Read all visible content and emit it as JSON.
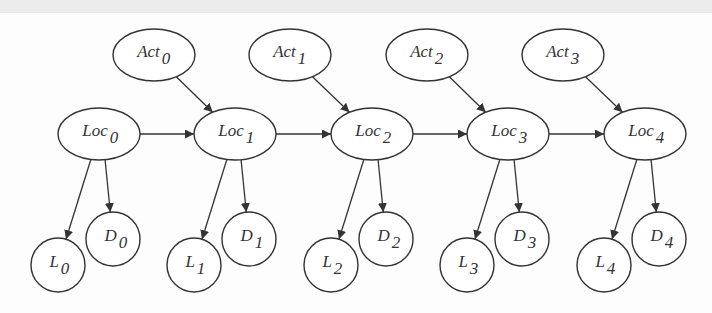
{
  "diagram": {
    "type": "dynamic-bayesian-network",
    "colors": {
      "stroke": "#333333",
      "background": "#fdfdfd",
      "top_band": "#ebebeb"
    },
    "nodes": [
      {
        "id": "Act0",
        "base": "Act",
        "sub": "0",
        "shape": "ellipse",
        "cx": 154,
        "cy": 55,
        "rx": 41,
        "ry": 26
      },
      {
        "id": "Act1",
        "base": "Act",
        "sub": "1",
        "shape": "ellipse",
        "cx": 290,
        "cy": 55,
        "rx": 41,
        "ry": 26
      },
      {
        "id": "Act2",
        "base": "Act",
        "sub": "2",
        "shape": "ellipse",
        "cx": 427,
        "cy": 55,
        "rx": 41,
        "ry": 26
      },
      {
        "id": "Act3",
        "base": "Act",
        "sub": "3",
        "shape": "ellipse",
        "cx": 563,
        "cy": 55,
        "rx": 41,
        "ry": 26
      },
      {
        "id": "Loc0",
        "base": "Loc",
        "sub": "0",
        "shape": "ellipse",
        "cx": 99,
        "cy": 134,
        "rx": 41,
        "ry": 26
      },
      {
        "id": "Loc1",
        "base": "Loc",
        "sub": "1",
        "shape": "ellipse",
        "cx": 235,
        "cy": 134,
        "rx": 41,
        "ry": 26
      },
      {
        "id": "Loc2",
        "base": "Loc",
        "sub": "2",
        "shape": "ellipse",
        "cx": 372,
        "cy": 134,
        "rx": 41,
        "ry": 26
      },
      {
        "id": "Loc3",
        "base": "Loc",
        "sub": "3",
        "shape": "ellipse",
        "cx": 508,
        "cy": 134,
        "rx": 41,
        "ry": 26
      },
      {
        "id": "Loc4",
        "base": "Loc",
        "sub": "4",
        "shape": "ellipse",
        "cx": 645,
        "cy": 134,
        "rx": 41,
        "ry": 26
      },
      {
        "id": "L0",
        "base": "L",
        "sub": "0",
        "shape": "circle",
        "cx": 58,
        "cy": 265,
        "rx": 27,
        "ry": 27
      },
      {
        "id": "D0",
        "base": "D",
        "sub": "0",
        "shape": "circle",
        "cx": 113,
        "cy": 239,
        "rx": 27,
        "ry": 27
      },
      {
        "id": "L1",
        "base": "L",
        "sub": "1",
        "shape": "circle",
        "cx": 194,
        "cy": 265,
        "rx": 27,
        "ry": 27
      },
      {
        "id": "D1",
        "base": "D",
        "sub": "1",
        "shape": "circle",
        "cx": 249,
        "cy": 239,
        "rx": 27,
        "ry": 27
      },
      {
        "id": "L2",
        "base": "L",
        "sub": "2",
        "shape": "circle",
        "cx": 331,
        "cy": 265,
        "rx": 27,
        "ry": 27
      },
      {
        "id": "D2",
        "base": "D",
        "sub": "2",
        "shape": "circle",
        "cx": 386,
        "cy": 239,
        "rx": 27,
        "ry": 27
      },
      {
        "id": "L3",
        "base": "L",
        "sub": "3",
        "shape": "circle",
        "cx": 467,
        "cy": 265,
        "rx": 27,
        "ry": 27
      },
      {
        "id": "D3",
        "base": "D",
        "sub": "3",
        "shape": "circle",
        "cx": 522,
        "cy": 239,
        "rx": 27,
        "ry": 27
      },
      {
        "id": "L4",
        "base": "L",
        "sub": "4",
        "shape": "circle",
        "cx": 604,
        "cy": 265,
        "rx": 27,
        "ry": 27
      },
      {
        "id": "D4",
        "base": "D",
        "sub": "4",
        "shape": "circle",
        "cx": 659,
        "cy": 239,
        "rx": 27,
        "ry": 27
      }
    ],
    "edges": [
      {
        "from": "Act0",
        "to": "Loc1"
      },
      {
        "from": "Act1",
        "to": "Loc2"
      },
      {
        "from": "Act2",
        "to": "Loc3"
      },
      {
        "from": "Act3",
        "to": "Loc4"
      },
      {
        "from": "Loc0",
        "to": "Loc1"
      },
      {
        "from": "Loc1",
        "to": "Loc2"
      },
      {
        "from": "Loc2",
        "to": "Loc3"
      },
      {
        "from": "Loc3",
        "to": "Loc4"
      },
      {
        "from": "Loc0",
        "to": "L0"
      },
      {
        "from": "Loc0",
        "to": "D0"
      },
      {
        "from": "Loc1",
        "to": "L1"
      },
      {
        "from": "Loc1",
        "to": "D1"
      },
      {
        "from": "Loc2",
        "to": "L2"
      },
      {
        "from": "Loc2",
        "to": "D2"
      },
      {
        "from": "Loc3",
        "to": "L3"
      },
      {
        "from": "Loc3",
        "to": "D3"
      },
      {
        "from": "Loc4",
        "to": "L4"
      },
      {
        "from": "Loc4",
        "to": "D4"
      }
    ]
  }
}
